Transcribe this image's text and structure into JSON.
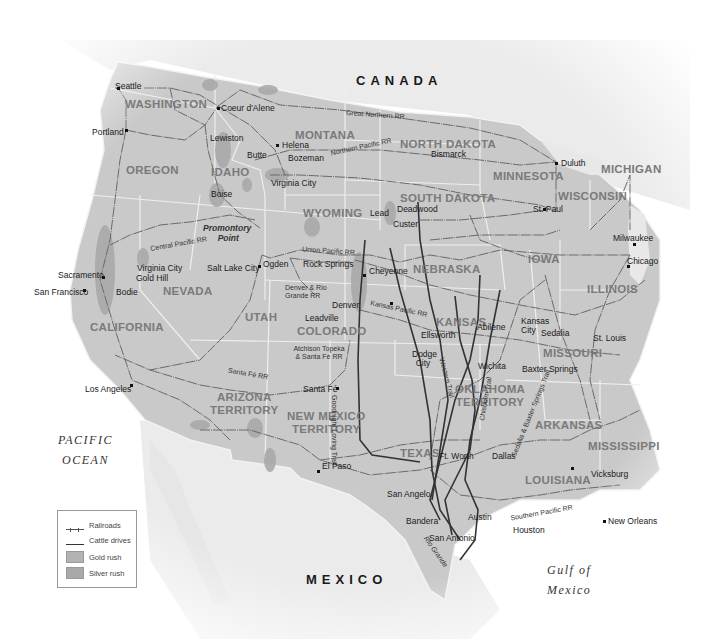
{
  "map": {
    "title_regions": {
      "canada": "CANADA",
      "mexico": "MEXICO",
      "pacific": [
        "PACIFIC",
        "OCEAN"
      ],
      "gulf": [
        "Gulf of",
        "Mexico"
      ]
    },
    "states": [
      {
        "id": "washington",
        "label": "WASHINGTON"
      },
      {
        "id": "oregon",
        "label": "OREGON"
      },
      {
        "id": "idaho",
        "label": "IDAHO"
      },
      {
        "id": "montana",
        "label": "MONTANA"
      },
      {
        "id": "wyoming",
        "label": "WYOMING"
      },
      {
        "id": "north-dakota",
        "label": "NORTH DAKOTA"
      },
      {
        "id": "south-dakota",
        "label": "SOUTH DAKOTA"
      },
      {
        "id": "minnesota",
        "label": "MINNESOTA"
      },
      {
        "id": "wisconsin",
        "label": "WISCONSIN"
      },
      {
        "id": "michigan",
        "label": "MICHIGAN"
      },
      {
        "id": "nevada",
        "label": "NEVADA"
      },
      {
        "id": "california",
        "label": "CALIFORNIA"
      },
      {
        "id": "utah",
        "label": "UTAH"
      },
      {
        "id": "colorado",
        "label": "COLORADO"
      },
      {
        "id": "nebraska",
        "label": "NEBRASKA"
      },
      {
        "id": "iowa",
        "label": "IOWA"
      },
      {
        "id": "illinois",
        "label": "ILLINOIS"
      },
      {
        "id": "kansas",
        "label": "KANSAS"
      },
      {
        "id": "missouri",
        "label": "MISSOURI"
      },
      {
        "id": "arizona",
        "label": "ARIZONA\nTERRITORY"
      },
      {
        "id": "new-mexico",
        "label": "NEW MEXICO\nTERRITORY"
      },
      {
        "id": "oklahoma",
        "label": "OKLAHOMA\nTERRITORY"
      },
      {
        "id": "texas",
        "label": "TEXAS"
      },
      {
        "id": "arkansas",
        "label": "ARKANSAS"
      },
      {
        "id": "mississippi",
        "label": "MISSISSIPPI"
      },
      {
        "id": "louisiana",
        "label": "LOUISIANA"
      }
    ],
    "cities": [
      "Seattle",
      "Coeur d'Alene",
      "Portland",
      "Lewiston",
      "Helena",
      "Butte",
      "Bozeman",
      "Virginia City",
      "Boise",
      "Bismarck",
      "Duluth",
      "St. Paul",
      "Lead",
      "Deadwood",
      "Custer",
      "Promontory Point",
      "Ogden",
      "Salt Lake City",
      "Rock Springs",
      "Cheyenne",
      "Sacramento",
      "San Francisco",
      "Virginia City",
      "Gold Hill",
      "Bodie",
      "Denver",
      "Leadville",
      "Milwaukee",
      "Chicago",
      "Ellsworth",
      "Abilene",
      "Kansas City",
      "Sedalia",
      "St. Louis",
      "Dodge City",
      "Wichita",
      "Baxter Springs",
      "Los Angeles",
      "Santa Fé",
      "El Paso",
      "San Angelo",
      "Ft. Worth",
      "Dallas",
      "Vicksburg",
      "Austin",
      "Bandera",
      "San Antonio",
      "Houston",
      "New Orleans"
    ],
    "railroads": [
      "Great Northern RR",
      "Northern Pacific RR",
      "Central Pacific RR",
      "Union Pacific RR",
      "Denver & Rio Grande RR",
      "Kansas Pacific RR",
      "Atchison Topeka & Santa Fé RR",
      "Santa Fé RR",
      "Southern Pacific RR"
    ],
    "cattle_trails": [
      "Goodnight Loving Trail",
      "Western Trail",
      "Chisholm Trail",
      "Sedalia & Baxter Springs Trail"
    ],
    "other_labels": {
      "rio_grande": "Rio Grande"
    }
  },
  "legend": {
    "items": [
      {
        "symbol": "railroad",
        "label": "Railroads"
      },
      {
        "symbol": "cattle",
        "label": "Cattle drives"
      },
      {
        "symbol": "gold",
        "label": "Gold rush"
      },
      {
        "symbol": "silver",
        "label": "Silver rush"
      }
    ]
  },
  "colors": {
    "land_us": "#c9c9c9",
    "land_other": "#e3e3e3",
    "water": "#ffffff",
    "gold_rush": "#b3b3b3",
    "silver_rush": "#a9a9a9",
    "railroad": "#666666",
    "cattle": "#333333",
    "border": "#f5f5f5"
  }
}
